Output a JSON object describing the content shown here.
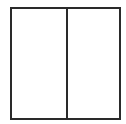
{
  "diagram": {
    "shape": "rectangle",
    "divided": "vertical",
    "panels": [
      {
        "id": "left",
        "label": ""
      },
      {
        "id": "right",
        "label": ""
      }
    ],
    "stroke_color": "#2a2a2a",
    "fill_color": "#ffffff"
  }
}
